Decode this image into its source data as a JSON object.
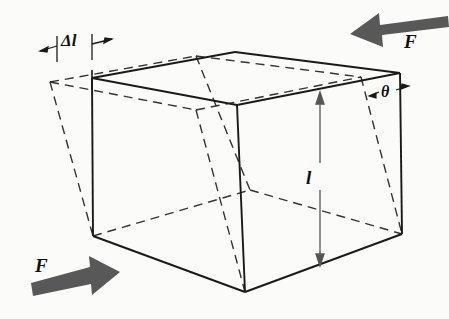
{
  "figure": {
    "background_color": "#fbfbf9",
    "line_color": "#1a1a1a",
    "arrow_color": "#585858",
    "dashed_color": "#333333"
  },
  "labels": {
    "force_top_right": "F",
    "force_bottom_left": "F",
    "delta_length": "Δl",
    "length": "l",
    "shear_angle": "θ"
  },
  "icons": {
    "force_arrow_left": "arrow-left-icon",
    "force_arrow_right": "arrow-right-icon",
    "dimension_arrow_vertical": "double-arrow-vertical-icon",
    "dimension_arrow_delta": "dimension-arrow-icon",
    "angle_arrow": "angle-indicator-icon"
  },
  "geometry": {
    "deformed_solid": {
      "top_left": [
        92,
        78
      ],
      "top_back": [
        235,
        52
      ],
      "top_right": [
        400,
        73
      ],
      "top_front": [
        237,
        105
      ],
      "bottom_left": [
        93,
        236
      ],
      "bottom_front": [
        245,
        292
      ],
      "bottom_right": [
        402,
        234
      ],
      "bottom_back": [
        250,
        190
      ]
    },
    "original_dashed": {
      "top_left": [
        50,
        82
      ],
      "top_back": [
        196,
        56
      ],
      "top_front": [
        196,
        110
      ],
      "bottom_left": [
        93,
        236
      ],
      "bottom_front": [
        245,
        292
      ],
      "bottom_right": [
        402,
        234
      ]
    },
    "delta_l_extent": [
      57,
      92
    ],
    "length_dimension_x": 320,
    "length_dimension_y": [
      96,
      262
    ]
  }
}
